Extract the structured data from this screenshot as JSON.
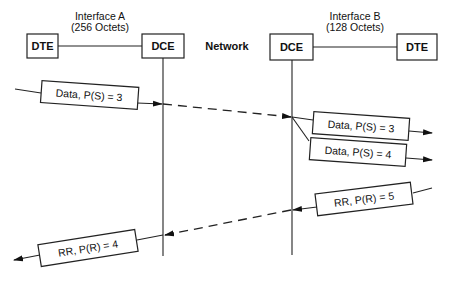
{
  "diagram": {
    "nodes": {
      "dte_left": "DTE",
      "dce_left": "DCE",
      "network": "Network",
      "dce_right": "DCE",
      "dte_right": "DTE"
    },
    "interfaces": {
      "a_name": "Interface A",
      "a_size": "(256 Octets)",
      "b_name": "Interface B",
      "b_size": "(128 Octets)"
    },
    "messages": [
      {
        "label": "Data, P(S) = 3",
        "direction": "right"
      },
      {
        "label": "Data, P(S) = 3",
        "direction": "right"
      },
      {
        "label": "Data, P(S) = 4",
        "direction": "right"
      },
      {
        "label": "RR, P(R) = 5",
        "direction": "left"
      },
      {
        "label": "RR, P(R) = 4",
        "direction": "left"
      }
    ],
    "colors": {
      "ink": "#222222",
      "background": "#ffffff"
    }
  }
}
